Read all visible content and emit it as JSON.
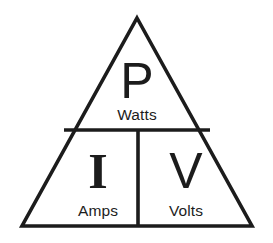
{
  "diagram": {
    "type": "formula-triangle",
    "background_color": "#ffffff",
    "stroke_color": "#1c1c1c",
    "stroke_width": 3.6,
    "geometry": {
      "apex": [
        137,
        18
      ],
      "base_left": [
        22,
        226
      ],
      "base_right": [
        252,
        226
      ],
      "horizontal_divider": {
        "y": 130,
        "x_start": 64,
        "x_end": 210
      },
      "vertical_divider": {
        "x": 138,
        "y_start": 130,
        "y_end": 226
      }
    },
    "cells": [
      {
        "id": "power",
        "position": "top",
        "symbol": "P",
        "unit": "Watts",
        "symbol_style": "sans"
      },
      {
        "id": "current",
        "position": "bottom-left",
        "symbol": "I",
        "unit": "Amps",
        "symbol_style": "serif"
      },
      {
        "id": "voltage",
        "position": "bottom-right",
        "symbol": "V",
        "unit": "Volts",
        "symbol_style": "sans"
      }
    ]
  }
}
